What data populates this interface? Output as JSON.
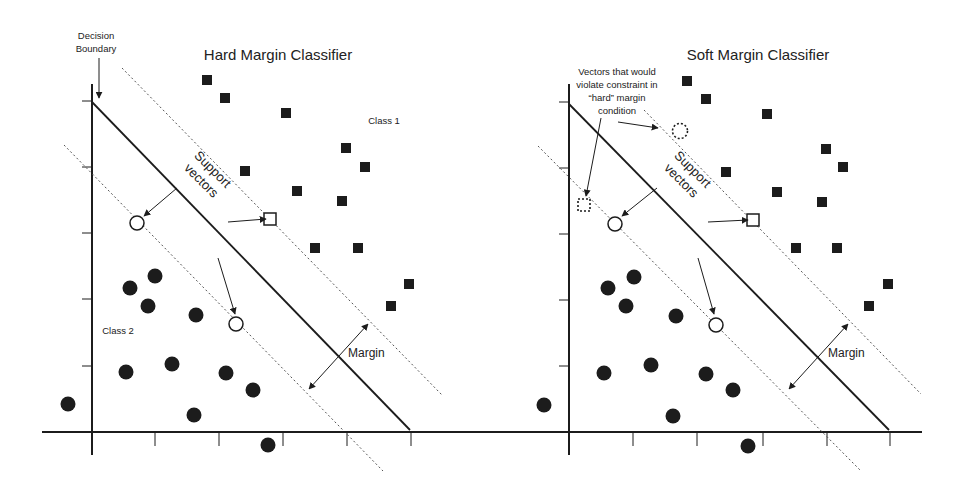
{
  "figure": {
    "width": 960,
    "height": 485,
    "colors": {
      "ink": "#1c1c1c",
      "dash": "#555555",
      "background": "#ffffff"
    }
  },
  "panels": [
    {
      "id": "hard",
      "title": "Hard Margin Classifier",
      "title_pos": [
        278,
        60
      ],
      "axes": {
        "origin": [
          92,
          432
        ],
        "y_top": 84,
        "y_bottom": 455,
        "x_left": 46,
        "x_right": 443,
        "y_ticks": [
          101,
          167,
          233,
          299,
          366
        ],
        "x_ticks": [
          155,
          219,
          283,
          347,
          411
        ]
      },
      "decision_boundary": {
        "from": [
          92,
          102
        ],
        "to": [
          410,
          430
        ]
      },
      "upper_margin": {
        "from": [
          122,
          68
        ],
        "to": [
          442,
          395
        ]
      },
      "lower_margin": {
        "from": [
          64,
          145
        ],
        "to": [
          383,
          471
        ]
      },
      "class1_label": {
        "text": "Class 1",
        "pos": [
          384,
          124
        ]
      },
      "class2_label": {
        "text": "Class 2",
        "pos": [
          118,
          334
        ]
      },
      "decision_label": {
        "lines": [
          "Decision",
          "Boundary"
        ],
        "pos": [
          96,
          39
        ]
      },
      "decision_arrow": {
        "from": [
          99,
          58
        ],
        "to": [
          99,
          98
        ]
      },
      "support_label": {
        "lines": [
          "Support",
          "vectors"
        ],
        "pos": [
          204,
          178
        ],
        "rotate": 45
      },
      "margin_label": {
        "text": "Margin",
        "pos": [
          348,
          357
        ]
      },
      "margin_arrow": {
        "from": [
          309,
          389
        ],
        "to": [
          368,
          324
        ]
      },
      "class1_points": [
        [
          207,
          80
        ],
        [
          225,
          98
        ],
        [
          286,
          113
        ],
        [
          346,
          148
        ],
        [
          365,
          167
        ],
        [
          245,
          171
        ],
        [
          297,
          191
        ],
        [
          342,
          201
        ],
        [
          315,
          248
        ],
        [
          358,
          248
        ],
        [
          409,
          284
        ],
        [
          391,
          306
        ]
      ],
      "class2_points": [
        [
          130,
          288
        ],
        [
          155,
          276
        ],
        [
          148,
          306
        ],
        [
          196,
          315
        ],
        [
          68,
          404
        ],
        [
          126,
          372
        ],
        [
          172,
          364
        ],
        [
          226,
          373
        ],
        [
          253,
          390
        ],
        [
          194,
          415
        ],
        [
          268,
          445
        ]
      ],
      "support_square": [
        270,
        219
      ],
      "support_circles": [
        [
          137,
          223
        ],
        [
          236,
          324
        ]
      ],
      "sv_arrows": [
        {
          "from": [
            228,
            222
          ],
          "to": [
            266,
            219
          ]
        },
        {
          "from": [
            177,
            188
          ],
          "to": [
            144,
            216
          ]
        },
        {
          "from": [
            218,
            258
          ],
          "to": [
            235,
            314
          ]
        }
      ],
      "violators": []
    },
    {
      "id": "soft",
      "title": "Soft Margin Classifier",
      "title_pos": [
        758,
        60
      ],
      "axes": {
        "origin": [
          569,
          432
        ],
        "y_top": 84,
        "y_bottom": 455,
        "x_left": 42,
        "x_right": 922,
        "y_ticks": [
          102,
          168,
          234,
          300,
          366
        ],
        "x_ticks": [
          633,
          697,
          763,
          827,
          890
        ]
      },
      "decision_boundary": {
        "from": [
          569,
          104
        ],
        "to": [
          889,
          430
        ]
      },
      "upper_margin": {
        "from": [
          644,
          110
        ],
        "to": [
          921,
          394
        ]
      },
      "lower_margin": {
        "from": [
          538,
          146
        ],
        "to": [
          861,
          471
        ]
      },
      "class1_label": null,
      "class2_label": null,
      "violation_label": {
        "lines": [
          "Vectors that would",
          "violate constraint in",
          "“hard” margin",
          "condition"
        ],
        "pos": [
          617,
          75
        ]
      },
      "violation_arrows": [
        {
          "from": [
            618,
            122
          ],
          "to": [
            658,
            128
          ]
        },
        {
          "from": [
            601,
            118
          ],
          "to": [
            586,
            196
          ]
        }
      ],
      "support_label": {
        "lines": [
          "Support",
          "vectors"
        ],
        "pos": [
          684,
          178
        ],
        "rotate": 45
      },
      "margin_label": {
        "text": "Margin",
        "pos": [
          828,
          357
        ]
      },
      "margin_arrow": {
        "from": [
          789,
          389
        ],
        "to": [
          848,
          324
        ]
      },
      "class1_points": [
        [
          687,
          81
        ],
        [
          706,
          99
        ],
        [
          767,
          114
        ],
        [
          826,
          149
        ],
        [
          843,
          167
        ],
        [
          726,
          172
        ],
        [
          777,
          192
        ],
        [
          822,
          202
        ],
        [
          796,
          248
        ],
        [
          837,
          248
        ],
        [
          888,
          284
        ],
        [
          869,
          306
        ]
      ],
      "class2_points": [
        [
          608,
          288
        ],
        [
          634,
          277
        ],
        [
          626,
          306
        ],
        [
          676,
          316
        ],
        [
          544,
          405
        ],
        [
          604,
          373
        ],
        [
          651,
          365
        ],
        [
          706,
          374
        ],
        [
          733,
          390
        ],
        [
          673,
          416
        ],
        [
          748,
          446
        ]
      ],
      "support_square": [
        753,
        220
      ],
      "support_circles": [
        [
          615,
          224
        ],
        [
          716,
          325
        ]
      ],
      "sv_arrows": [
        {
          "from": [
            708,
            222
          ],
          "to": [
            748,
            220
          ]
        },
        {
          "from": [
            657,
            188
          ],
          "to": [
            622,
            216
          ]
        },
        {
          "from": [
            698,
            258
          ],
          "to": [
            714,
            314
          ]
        }
      ],
      "violators": [
        {
          "shape": "circle",
          "pos": [
            680,
            131
          ]
        },
        {
          "shape": "square",
          "pos": [
            584,
            205
          ]
        }
      ]
    }
  ]
}
